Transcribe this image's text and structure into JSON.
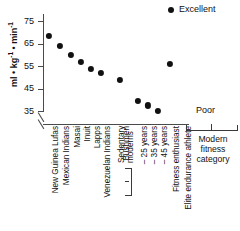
{
  "legend": {
    "label": "Excellent",
    "marker": "filled-circle",
    "color": "#111111"
  },
  "axis": {
    "y_title_main": "ml • kg",
    "y_title_sup1": "-1",
    "y_title_mid": " • min",
    "y_title_sup2": "-1",
    "y_ticks": [
      35,
      45,
      55,
      65,
      75
    ],
    "y_min": 33,
    "y_max": 79,
    "has_axis_break": true
  },
  "annotations": {
    "poor": "Poor",
    "modern_fitness_category": [
      "Modern",
      "fitness",
      "category"
    ],
    "sedentary_group": [
      "Sedentary",
      "moderns"
    ]
  },
  "chart_data": {
    "type": "scatter",
    "title": "",
    "xlabel": "",
    "ylabel": "ml • kg-1 • min-1",
    "ylim": [
      33,
      79
    ],
    "grid": false,
    "legend_position": "top-right",
    "series_name": "Excellent",
    "categories": [
      "New Guinea Lufas",
      "Mexican Indians",
      "Masai",
      "Inuit",
      "Lapps",
      "Venezuelan Indians",
      "Bushmen",
      "– 25 years",
      "– 35 years",
      "– 45 years",
      "Fitness enthusiast",
      "Elite endurance athlete"
    ],
    "values": [
      68.3,
      64.0,
      60.0,
      57.0,
      53.8,
      52.0,
      49.0,
      39.5,
      37.5,
      35.2,
      55.8,
      null
    ],
    "points": [
      {
        "label": "New Guinea Lufas",
        "value": 68.3
      },
      {
        "label": "Mexican Indians",
        "value": 64.0
      },
      {
        "label": "Masai",
        "value": 60.0
      },
      {
        "label": "Inuit",
        "value": 57.0
      },
      {
        "label": "Lapps",
        "value": 53.8
      },
      {
        "label": "Venezuelan Indians",
        "value": 52.0
      },
      {
        "label": "Bushmen",
        "value": 49.0
      },
      {
        "label": "– 25 years",
        "value": 39.5
      },
      {
        "label": "– 35 years",
        "value": 37.5
      },
      {
        "label": "– 45 years",
        "value": 35.2
      },
      {
        "label": "Fitness enthusiast",
        "value": 55.8
      },
      {
        "label": "Elite endurance athlete",
        "value": null
      }
    ]
  }
}
